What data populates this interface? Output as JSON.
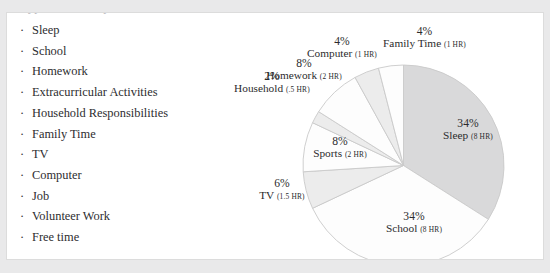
{
  "slide": {
    "clipped_header_text": "Typical Weekday for a Student"
  },
  "bullet_list": {
    "bullet_glyph": "·",
    "items": [
      {
        "label": "Sleep"
      },
      {
        "label": "School"
      },
      {
        "label": "Homework"
      },
      {
        "label": "Extracurricular Activities"
      },
      {
        "label": "Household Responsibilities"
      },
      {
        "label": "Family Time"
      },
      {
        "label": "TV"
      },
      {
        "label": "Computer"
      },
      {
        "label": "Job"
      },
      {
        "label": "Volunteer Work"
      },
      {
        "label": "Free time"
      }
    ]
  },
  "chart_data": {
    "type": "pie",
    "title": "",
    "total_hours": 24,
    "start_angle_deg": 0,
    "direction": "clockwise",
    "legend": "none",
    "labels": [
      "Sleep",
      "School",
      "TV",
      "Sports",
      "Household",
      "Homework",
      "Computer",
      "Family Time"
    ],
    "values": [
      34,
      34,
      6,
      8,
      2,
      8,
      4,
      4
    ],
    "hours": [
      "8 HR",
      "8 HR",
      "1.5 HR",
      "2 HR",
      ".5 HR",
      "2 HR",
      "1 HR",
      "1 HR"
    ],
    "slices": [
      {
        "name": "Sleep",
        "percent_text": "34%",
        "hours_text": "(8 HR)",
        "value": 34,
        "hours": 8,
        "color": "#d9d9da",
        "label_position": "inside"
      },
      {
        "name": "School",
        "percent_text": "34%",
        "hours_text": "(8 HR)",
        "value": 34,
        "hours": 8,
        "color": "#fdfdfd",
        "label_position": "inside"
      },
      {
        "name": "TV",
        "percent_text": "6%",
        "hours_text": "(1.5 HR)",
        "value": 6,
        "hours": 1.5,
        "color": "#ececec",
        "label_position": "outside"
      },
      {
        "name": "Sports",
        "percent_text": "8%",
        "hours_text": "(2 HR)",
        "value": 8,
        "hours": 2,
        "color": "#fdfdfd",
        "label_position": "inside"
      },
      {
        "name": "Household",
        "percent_text": "2%",
        "hours_text": "(.5 HR)",
        "value": 2,
        "hours": 0.5,
        "color": "#ececec",
        "label_position": "outside"
      },
      {
        "name": "Homework",
        "percent_text": "8%",
        "hours_text": "(2 HR)",
        "value": 8,
        "hours": 2,
        "color": "#fdfdfd",
        "label_position": "outside"
      },
      {
        "name": "Computer",
        "percent_text": "4%",
        "hours_text": "(1 HR)",
        "value": 4,
        "hours": 1,
        "color": "#ececec",
        "label_position": "outside"
      },
      {
        "name": "Family Time",
        "percent_text": "4%",
        "hours_text": "(1 HR)",
        "value": 4,
        "hours": 1,
        "color": "#fdfdfd",
        "label_position": "outside"
      }
    ],
    "colors": {
      "slice_dark": "#d9d9da",
      "slice_light": "#ececec",
      "slice_white": "#fdfdfd",
      "slice_outline": "#c9c9ca",
      "text": "#2b2b2d"
    }
  }
}
